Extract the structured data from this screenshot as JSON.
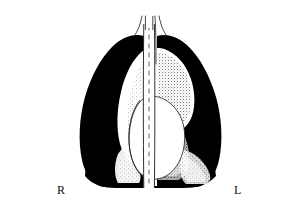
{
  "figure": {
    "modality": "chest-x-ray",
    "view": "posteroanterior",
    "rendering": "inverted-tone line art",
    "background_color": "#ffffff",
    "ink_color": "#000000",
    "frame_color": "#6b6b6b"
  },
  "labels": {
    "right_side": "R",
    "left_side": "L"
  },
  "anatomy": {
    "items": [
      {
        "name": "right-lung-field",
        "tone": "black",
        "side": "right"
      },
      {
        "name": "left-lung-field",
        "tone": "black",
        "side": "left"
      },
      {
        "name": "heart-silhouette",
        "tone": "white",
        "side": "central"
      },
      {
        "name": "spine-column",
        "tone": "white",
        "side": "central"
      },
      {
        "name": "trachea",
        "tone": "white",
        "side": "central"
      },
      {
        "name": "left-upper-lobe-opacity",
        "tone": "stippled-white",
        "side": "left"
      },
      {
        "name": "right-perihilar-opacity",
        "tone": "stippled-white",
        "side": "right"
      },
      {
        "name": "left-costophrenic-opacity",
        "tone": "stippled-white",
        "side": "left"
      },
      {
        "name": "neck-shoulder-contour",
        "tone": "outline",
        "side": "bilateral"
      },
      {
        "name": "diaphragm",
        "tone": "black",
        "side": "bilateral"
      }
    ]
  }
}
